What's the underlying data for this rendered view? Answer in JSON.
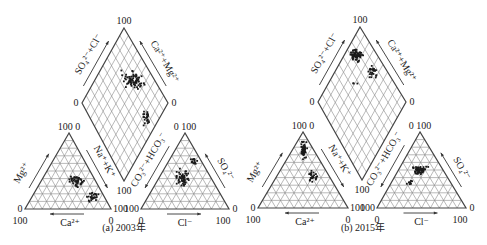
{
  "figure": {
    "type": "piper-diagram",
    "panels": [
      {
        "id": "a",
        "caption": "(a) 2003年",
        "caption_pos": [
          124,
          231
        ],
        "diamond": {
          "top": [
            124,
            28
          ],
          "left": [
            82,
            103
          ],
          "right": [
            168,
            103
          ],
          "bottom": [
            124,
            181
          ]
        },
        "cation_triangle": {
          "apex": [
            69,
            133
          ],
          "left": [
            25,
            209
          ],
          "right": [
            111,
            209
          ]
        },
        "anion_triangle": {
          "apex": [
            185,
            133
          ],
          "left": [
            141,
            209
          ],
          "right": [
            229,
            209
          ]
        },
        "labels": {
          "diamond_top": "100",
          "diamond_left": "0",
          "diamond_right": "0",
          "diamond_bottom": "100",
          "diamond_left_axis": "SO₄²⁻+Cl⁻",
          "diamond_right_axis": "Ca²⁺+Mg²⁺",
          "cat_apex": "100 0",
          "cat_left_low": "0",
          "cat_left_bottom": "100",
          "cat_right_bottom": "0",
          "cat_right_end": "100",
          "cat_left_axis": "Mg²⁺",
          "cat_right_axis": "Na⁺+K⁺",
          "cat_bottom_axis": "Ca²⁺",
          "an_apex": "0 100",
          "an_left_end": "100",
          "an_left_bottom": "0",
          "an_right_bottom": "100",
          "an_right_end": "0",
          "an_left_axis": "CO₃²⁻+HCO₃⁻",
          "an_right_axis": "SO₄²⁻",
          "an_bottom_axis": "Cl⁻"
        },
        "clusters": [
          {
            "region": "diamond",
            "cx": 133,
            "cy": 80,
            "rx": 14,
            "ry": 11,
            "n": 70
          },
          {
            "region": "diamond",
            "cx": 146,
            "cy": 118,
            "rx": 5,
            "ry": 14,
            "n": 25
          },
          {
            "region": "cat",
            "cx": 77,
            "cy": 181,
            "rx": 10,
            "ry": 8,
            "n": 45
          },
          {
            "region": "cat",
            "cx": 93,
            "cy": 197,
            "rx": 7,
            "ry": 6,
            "n": 25
          },
          {
            "region": "an",
            "cx": 182,
            "cy": 178,
            "rx": 10,
            "ry": 12,
            "n": 55
          },
          {
            "region": "an",
            "cx": 194,
            "cy": 160,
            "rx": 4,
            "ry": 10,
            "n": 15
          }
        ]
      },
      {
        "id": "b",
        "caption": "(b) 2015年",
        "caption_pos": [
          363,
          231
        ],
        "diamond": {
          "top": [
            360,
            27
          ],
          "left": [
            318,
            102
          ],
          "right": [
            406,
            102
          ],
          "bottom": [
            362,
            180
          ]
        },
        "cation_triangle": {
          "apex": [
            303,
            132
          ],
          "left": [
            258,
            208
          ],
          "right": [
            348,
            208
          ]
        },
        "anion_triangle": {
          "apex": [
            420,
            132
          ],
          "left": [
            377,
            208
          ],
          "right": [
            466,
            208
          ]
        },
        "labels": {
          "diamond_top": "100",
          "diamond_left": "0",
          "diamond_right": "0",
          "diamond_bottom": "100",
          "diamond_left_axis": "SO₄²⁻+Cl⁻",
          "diamond_right_axis": "Ca²⁺+Mg²⁺",
          "cat_apex": "100 0",
          "cat_left_low": "0",
          "cat_left_bottom": "100",
          "cat_right_bottom": "0",
          "cat_right_end": "100",
          "cat_left_axis": "Mg²⁺",
          "cat_right_axis": "Na⁺+K⁺",
          "cat_bottom_axis": "Ca²⁺",
          "an_apex": "0 100",
          "an_left_end": "100",
          "an_left_bottom": "0",
          "an_right_bottom": "100",
          "an_right_end": "0",
          "an_left_axis": "CO₃²⁻+HCO₃⁻",
          "an_right_axis": "SO₄²⁻",
          "an_bottom_axis": "Cl⁻"
        },
        "clusters": [
          {
            "region": "diamond",
            "cx": 356,
            "cy": 55,
            "rx": 9,
            "ry": 8,
            "n": 70
          },
          {
            "region": "diamond",
            "cx": 372,
            "cy": 72,
            "rx": 7,
            "ry": 9,
            "n": 25
          },
          {
            "region": "diamond",
            "cx": 355,
            "cy": 85,
            "rx": 4,
            "ry": 3,
            "n": 3
          },
          {
            "region": "cat",
            "cx": 304,
            "cy": 150,
            "rx": 4,
            "ry": 12,
            "n": 50
          },
          {
            "region": "cat",
            "cx": 312,
            "cy": 175,
            "rx": 8,
            "ry": 8,
            "n": 25
          },
          {
            "region": "an",
            "cx": 420,
            "cy": 170,
            "rx": 9,
            "ry": 7,
            "n": 55
          },
          {
            "region": "an",
            "cx": 410,
            "cy": 183,
            "rx": 5,
            "ry": 4,
            "n": 8
          }
        ]
      }
    ],
    "colors": {
      "frame": "#444444",
      "grid": "#8a8a8a",
      "point": "#1a1a1a",
      "arrow": "#333333"
    }
  }
}
